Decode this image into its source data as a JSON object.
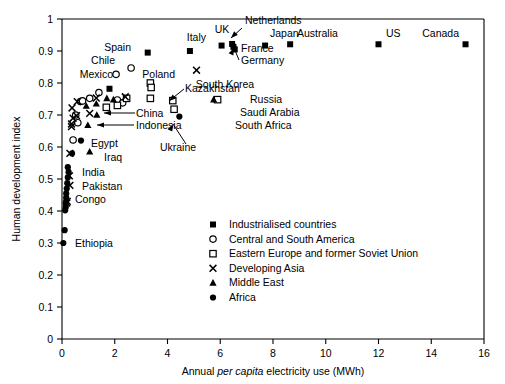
{
  "chart_data": {
    "type": "scatter",
    "title": "",
    "xlabel_parts": {
      "pre": "Annual ",
      "italic": "per capita",
      "post": " electricity use (MWh)"
    },
    "xlabel": "Annual per capita electricity use (MWh)",
    "ylabel": "Human development index",
    "xlim": [
      0,
      16
    ],
    "ylim": [
      0,
      1
    ],
    "xticks": [
      "0",
      "2",
      "4",
      "6",
      "8",
      "10",
      "12",
      "14",
      "16"
    ],
    "xtick_values": [
      0,
      2,
      4,
      6,
      8,
      10,
      12,
      14,
      16
    ],
    "yticks": [
      "0",
      "0.1",
      "0.2",
      "0.3",
      "0.4",
      "0.5",
      "0.6",
      "0.7",
      "0.8",
      "0.9",
      "1"
    ],
    "ytick_values": [
      0,
      0.1,
      0.2,
      0.3,
      0.4,
      0.5,
      0.6,
      0.7,
      0.8,
      0.9,
      1
    ],
    "grid": false,
    "legend_position": "inside-bottom-right",
    "legend": [
      {
        "label": "Industrialised countries",
        "marker": "filled-square",
        "group": "industrialised"
      },
      {
        "label": "Central and South America",
        "marker": "open-circle",
        "group": "central_south_america"
      },
      {
        "label": "Eastern Europe and former Soviet Union",
        "marker": "open-square",
        "group": "eastern_europe"
      },
      {
        "label": "Developing Asia",
        "marker": "cross",
        "group": "developing_asia"
      },
      {
        "label": "Middle East",
        "marker": "filled-triangle",
        "group": "middle_east"
      },
      {
        "label": "Africa",
        "marker": "filled-circle",
        "group": "africa"
      }
    ],
    "series": [
      {
        "name": "Industrialised countries",
        "marker": "filled-square",
        "points": [
          {
            "x": 3.25,
            "y": 0.895,
            "label": "Spain"
          },
          {
            "x": 4.85,
            "y": 0.9,
            "label": "Italy"
          },
          {
            "x": 6.05,
            "y": 0.917,
            "label": "UK"
          },
          {
            "x": 6.45,
            "y": 0.922,
            "label": "Netherlands"
          },
          {
            "x": 6.55,
            "y": 0.905,
            "label": "Germany"
          },
          {
            "x": 6.5,
            "y": 0.913,
            "label": "France"
          },
          {
            "x": 7.7,
            "y": 0.917,
            "label": "Japan"
          },
          {
            "x": 8.65,
            "y": 0.921,
            "label": "Australia"
          },
          {
            "x": 12.0,
            "y": 0.921,
            "label": "US"
          },
          {
            "x": 15.3,
            "y": 0.921,
            "label": "Canada"
          },
          {
            "x": 1.8,
            "y": 0.782,
            "label": ""
          }
        ]
      },
      {
        "name": "Central and South America",
        "marker": "open-circle",
        "points": [
          {
            "x": 2.62,
            "y": 0.847,
            "label": "Chile"
          },
          {
            "x": 2.05,
            "y": 0.827,
            "label": "Mexico"
          },
          {
            "x": 1.4,
            "y": 0.77,
            "label": ""
          },
          {
            "x": 1.05,
            "y": 0.752,
            "label": ""
          },
          {
            "x": 0.7,
            "y": 0.742,
            "label": ""
          },
          {
            "x": 0.78,
            "y": 0.744,
            "label": ""
          },
          {
            "x": 2.1,
            "y": 0.747,
            "label": ""
          },
          {
            "x": 2.3,
            "y": 0.738,
            "label": ""
          },
          {
            "x": 0.52,
            "y": 0.7,
            "label": ""
          },
          {
            "x": 0.42,
            "y": 0.622,
            "label": ""
          },
          {
            "x": 0.6,
            "y": 0.676,
            "label": ""
          }
        ]
      },
      {
        "name": "Eastern Europe and former Soviet Union",
        "marker": "open-square",
        "points": [
          {
            "x": 3.35,
            "y": 0.8,
            "label": "Poland"
          },
          {
            "x": 3.38,
            "y": 0.786,
            "label": ""
          },
          {
            "x": 3.35,
            "y": 0.752,
            "label": ""
          },
          {
            "x": 4.2,
            "y": 0.745,
            "label": "Kazakhstan"
          },
          {
            "x": 4.25,
            "y": 0.718,
            "label": "Ukraine"
          },
          {
            "x": 5.9,
            "y": 0.748,
            "label": "Russia"
          },
          {
            "x": 2.45,
            "y": 0.752,
            "label": ""
          },
          {
            "x": 2.1,
            "y": 0.73,
            "label": ""
          },
          {
            "x": 1.68,
            "y": 0.724,
            "label": ""
          }
        ]
      },
      {
        "name": "Developing Asia",
        "marker": "cross",
        "points": [
          {
            "x": 5.1,
            "y": 0.84,
            "label": "South Korea"
          },
          {
            "x": 2.4,
            "y": 0.757,
            "label": ""
          },
          {
            "x": 1.3,
            "y": 0.753,
            "label": ""
          },
          {
            "x": 0.58,
            "y": 0.742,
            "label": ""
          },
          {
            "x": 0.38,
            "y": 0.722,
            "label": ""
          },
          {
            "x": 1.05,
            "y": 0.705,
            "label": "China"
          },
          {
            "x": 0.55,
            "y": 0.698,
            "label": ""
          },
          {
            "x": 0.42,
            "y": 0.69,
            "label": ""
          },
          {
            "x": 0.36,
            "y": 0.672,
            "label": ""
          },
          {
            "x": 0.36,
            "y": 0.664,
            "label": ""
          },
          {
            "x": 0.3,
            "y": 0.58,
            "label": ""
          },
          {
            "x": 0.28,
            "y": 0.51,
            "label": "India"
          },
          {
            "x": 0.3,
            "y": 0.48,
            "label": "Pakistan"
          },
          {
            "x": 0.2,
            "y": 0.43,
            "label": ""
          },
          {
            "x": 0.18,
            "y": 0.425,
            "label": ""
          }
        ]
      },
      {
        "name": "Middle East",
        "marker": "filled-triangle",
        "points": [
          {
            "x": 5.75,
            "y": 0.748,
            "label": "Saudi Arabia"
          },
          {
            "x": 1.7,
            "y": 0.752,
            "label": ""
          },
          {
            "x": 1.95,
            "y": 0.748,
            "label": ""
          },
          {
            "x": 1.3,
            "y": 0.735,
            "label": ""
          },
          {
            "x": 0.92,
            "y": 0.728,
            "label": ""
          },
          {
            "x": 1.32,
            "y": 0.7,
            "label": ""
          },
          {
            "x": 0.98,
            "y": 0.668,
            "label": "Indonesia"
          },
          {
            "x": 1.05,
            "y": 0.585,
            "label": "Iraq"
          }
        ]
      },
      {
        "name": "Africa",
        "marker": "filled-circle",
        "points": [
          {
            "x": 4.45,
            "y": 0.695,
            "label": "South Africa"
          },
          {
            "x": 0.72,
            "y": 0.62,
            "label": "Egypt"
          },
          {
            "x": 0.38,
            "y": 0.58,
            "label": ""
          },
          {
            "x": 0.22,
            "y": 0.537,
            "label": ""
          },
          {
            "x": 0.25,
            "y": 0.522,
            "label": ""
          },
          {
            "x": 0.22,
            "y": 0.505,
            "label": ""
          },
          {
            "x": 0.2,
            "y": 0.487,
            "label": ""
          },
          {
            "x": 0.18,
            "y": 0.47,
            "label": "Congo"
          },
          {
            "x": 0.16,
            "y": 0.455,
            "label": ""
          },
          {
            "x": 0.16,
            "y": 0.442,
            "label": ""
          },
          {
            "x": 0.14,
            "y": 0.425,
            "label": ""
          },
          {
            "x": 0.14,
            "y": 0.412,
            "label": ""
          },
          {
            "x": 0.12,
            "y": 0.402,
            "label": ""
          },
          {
            "x": 0.1,
            "y": 0.34,
            "label": ""
          },
          {
            "x": 0.05,
            "y": 0.3,
            "label": "Ethiopia"
          }
        ]
      }
    ],
    "annotations": [
      {
        "text": "Spain",
        "anchor": "end"
      },
      {
        "text": "Italy",
        "anchor": "end"
      },
      {
        "text": "UK",
        "anchor": "middle"
      },
      {
        "text": "Netherlands",
        "anchor": "start"
      },
      {
        "text": "Japan",
        "anchor": "start"
      },
      {
        "text": "Australia",
        "anchor": "start"
      },
      {
        "text": "US",
        "anchor": "start"
      },
      {
        "text": "Canada",
        "anchor": "end"
      },
      {
        "text": "France",
        "anchor": "start"
      },
      {
        "text": "Germany",
        "anchor": "start"
      },
      {
        "text": "Chile",
        "anchor": "middle"
      },
      {
        "text": "Mexico",
        "anchor": "end"
      },
      {
        "text": "Poland",
        "anchor": "middle"
      },
      {
        "text": "South Korea",
        "anchor": "middle"
      },
      {
        "text": "Kazakhstan",
        "anchor": "start"
      },
      {
        "text": "Russia",
        "anchor": "start"
      },
      {
        "text": "Saudi Arabia",
        "anchor": "start"
      },
      {
        "text": "South Africa",
        "anchor": "start"
      },
      {
        "text": "Ukraine",
        "anchor": "middle"
      },
      {
        "text": "China",
        "anchor": "start"
      },
      {
        "text": "Indonesia",
        "anchor": "start"
      },
      {
        "text": "Egypt",
        "anchor": "start"
      },
      {
        "text": "Iraq",
        "anchor": "start"
      },
      {
        "text": "India",
        "anchor": "start"
      },
      {
        "text": "Pakistan",
        "anchor": "start"
      },
      {
        "text": "Congo",
        "anchor": "start"
      },
      {
        "text": "Ethiopia",
        "anchor": "start"
      }
    ]
  },
  "labels": {
    "spain": "Spain",
    "italy": "Italy",
    "uk": "UK",
    "netherlands": "Netherlands",
    "japan": "Japan",
    "australia": "Australia",
    "us": "US",
    "canada": "Canada",
    "france": "France",
    "germany": "Germany",
    "chile": "Chile",
    "mexico": "Mexico",
    "poland": "Poland",
    "south_korea": "South Korea",
    "kazakhstan": "Kazakhstan",
    "russia": "Russia",
    "saudi_arabia": "Saudi Arabia",
    "south_africa": "South Africa",
    "ukraine": "Ukraine",
    "china": "China",
    "indonesia": "Indonesia",
    "egypt": "Egypt",
    "iraq": "Iraq",
    "india": "India",
    "pakistan": "Pakistan",
    "congo": "Congo",
    "ethiopia": "Ethiopia"
  },
  "colors": {
    "ink": "#000000",
    "background": "#ffffff"
  }
}
